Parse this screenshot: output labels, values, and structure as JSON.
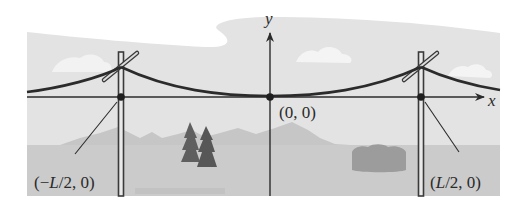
{
  "figure": {
    "axes": {
      "x_label": "x",
      "y_label": "y"
    },
    "points": [
      {
        "id": "left-pole-base",
        "label_prefix": "(−",
        "label_var": "L",
        "label_suffix": "/2, 0)"
      },
      {
        "id": "origin",
        "label": "(0, 0)"
      },
      {
        "id": "right-pole-base",
        "label_prefix": "(",
        "label_var": "L",
        "label_suffix": "/2, 0)"
      }
    ],
    "scene": {
      "elements": [
        "sky",
        "clouds",
        "mountains",
        "trees",
        "bush",
        "ground",
        "left-pole",
        "right-pole",
        "power-line"
      ]
    },
    "colors": {
      "sky": "#e3e3e3",
      "cloud": "#f4f4f4",
      "mountain": "#c4c4c4",
      "ground": "#cbcbcb",
      "tree": "#5e5e5e",
      "bush": "#9a9a9a",
      "line": "#2b2b2b",
      "pole": "#3a3a3a"
    }
  }
}
